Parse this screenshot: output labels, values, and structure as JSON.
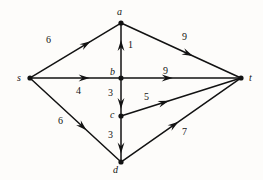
{
  "figure": {
    "background_color": "#fdfcfa",
    "stroke_color": "#121212",
    "text_color": "#131313"
  },
  "chart_data": {
    "type": "diagram",
    "title": "",
    "subtitle": "",
    "xlabel": "",
    "ylabel": "",
    "nodes": [
      {
        "id": "s",
        "label": "s",
        "x": 30,
        "y": 78,
        "label_x": 17,
        "label_y": 73
      },
      {
        "id": "a",
        "label": "a",
        "x": 121,
        "y": 23,
        "label_x": 117,
        "label_y": 7
      },
      {
        "id": "b",
        "label": "b",
        "x": 121,
        "y": 78,
        "label_x": 110,
        "label_y": 67
      },
      {
        "id": "c",
        "label": "c",
        "x": 121,
        "y": 116,
        "label_x": 110,
        "label_y": 110
      },
      {
        "id": "d",
        "label": "d",
        "x": 121,
        "y": 162,
        "label_x": 113,
        "label_y": 165
      },
      {
        "id": "t",
        "label": "t",
        "x": 241,
        "y": 78,
        "label_x": 249,
        "label_y": 73
      }
    ],
    "edges": [
      {
        "from": "s",
        "to": "a",
        "weight": 6,
        "label_x": 46,
        "label_y": 35,
        "arrow_pos": 0.62
      },
      {
        "from": "s",
        "to": "b",
        "weight": 4,
        "label_x": 76,
        "label_y": 86,
        "arrow_pos": 0.6
      },
      {
        "from": "s",
        "to": "d",
        "weight": 6,
        "label_x": 58,
        "label_y": 116,
        "arrow_pos": 0.58
      },
      {
        "from": "b",
        "to": "a",
        "weight": 1,
        "label_x": 128,
        "label_y": 40,
        "arrow_pos": 0.6
      },
      {
        "from": "a",
        "to": "t",
        "weight": 9,
        "label_x": 182,
        "label_y": 32,
        "arrow_pos": 0.56
      },
      {
        "from": "b",
        "to": "t",
        "weight": 9,
        "label_x": 163,
        "label_y": 66,
        "arrow_pos": 0.38
      },
      {
        "from": "b",
        "to": "c",
        "weight": 3,
        "label_x": 108,
        "label_y": 88,
        "arrow_pos": 0.7
      },
      {
        "from": "c",
        "to": "t",
        "weight": 5,
        "label_x": 144,
        "label_y": 92,
        "arrow_pos": 0.35
      },
      {
        "from": "c",
        "to": "d",
        "weight": 3,
        "label_x": 108,
        "label_y": 130,
        "arrow_pos": 0.72
      },
      {
        "from": "d",
        "to": "t",
        "weight": 7,
        "label_x": 182,
        "label_y": 127,
        "arrow_pos": 0.44
      }
    ]
  }
}
